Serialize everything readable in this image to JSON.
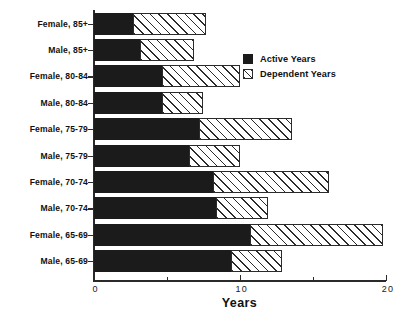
{
  "chart_data": {
    "type": "bar",
    "orientation": "horizontal",
    "stacked": true,
    "title": "",
    "xlabel": "Years",
    "ylabel": "",
    "xlim": [
      0,
      20
    ],
    "xticks": [
      0,
      10,
      20
    ],
    "xticklabels": [
      "0",
      "10",
      "20"
    ],
    "xminorticks": [
      5,
      15
    ],
    "grid": false,
    "legend_position": "upper right inside",
    "categories": [
      "Male, 65-69",
      "Female, 65-69",
      "Male, 70-74",
      "Female, 70-74",
      "Male, 75-79",
      "Female, 75-79",
      "Male, 80-84",
      "Female, 80-84",
      "Male, 85+",
      "Female, 85+"
    ],
    "series": [
      {
        "name": "Active Years",
        "color": "#1b1b1b",
        "pattern": "solid",
        "values": [
          9.4,
          10.7,
          8.4,
          8.2,
          6.5,
          7.2,
          4.7,
          4.7,
          3.2,
          2.7
        ]
      },
      {
        "name": "Dependent Years",
        "color": "#ffffff",
        "pattern": "diagonal-hatch",
        "values": [
          3.5,
          9.1,
          3.5,
          7.9,
          3.5,
          6.4,
          2.8,
          5.3,
          3.7,
          5.0
        ]
      }
    ],
    "totals": [
      12.9,
      19.8,
      11.9,
      16.1,
      10.0,
      13.6,
      7.5,
      10.0,
      6.9,
      7.7
    ]
  },
  "axis": {
    "xlabel": "Years",
    "ticklabels": [
      "0",
      "10",
      "20"
    ]
  },
  "legend": {
    "entries": [
      {
        "label": "Active Years",
        "swatch": "solid-black-swatch"
      },
      {
        "label": "Dependent Years",
        "swatch": "hatched-swatch"
      }
    ]
  }
}
